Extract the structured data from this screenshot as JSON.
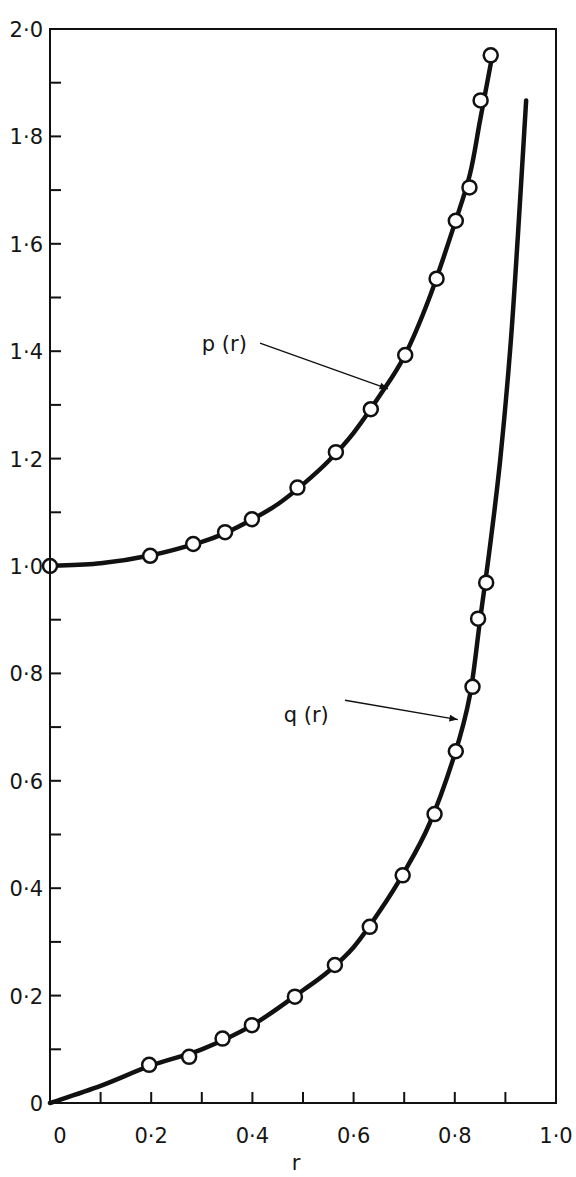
{
  "chart_data": {
    "type": "line",
    "title": "",
    "xlabel": "r",
    "ylabel": "",
    "xlim": [
      0,
      1.0
    ],
    "ylim": [
      0,
      2.0
    ],
    "grid": false,
    "legend": "inline labels with arrows",
    "x_ticks": [
      {
        "value": 0,
        "label": "0"
      },
      {
        "value": 0.2,
        "label": "0·2"
      },
      {
        "value": 0.4,
        "label": "0·4"
      },
      {
        "value": 0.6,
        "label": "0·6"
      },
      {
        "value": 0.8,
        "label": "0·8"
      },
      {
        "value": 1.0,
        "label": "1·0"
      }
    ],
    "x_minor_ticks": [
      0.1,
      0.3,
      0.5,
      0.7,
      0.9
    ],
    "y_ticks": [
      {
        "value": 0,
        "label": "0"
      },
      {
        "value": 0.2,
        "label": "0·2"
      },
      {
        "value": 0.4,
        "label": "0·4"
      },
      {
        "value": 0.6,
        "label": "0·6"
      },
      {
        "value": 0.8,
        "label": "0·8"
      },
      {
        "value": 1.0,
        "label": "1·0"
      },
      {
        "value": 1.2,
        "label": "1·2"
      },
      {
        "value": 1.4,
        "label": "1·4"
      },
      {
        "value": 1.6,
        "label": "1·6"
      },
      {
        "value": 1.8,
        "label": "1·8"
      },
      {
        "value": 2.0,
        "label": "2·0"
      }
    ],
    "y_minor_ticks": [
      0.1,
      0.3,
      0.5,
      0.7,
      0.9,
      1.1,
      1.3,
      1.5,
      1.7,
      1.9
    ],
    "series": [
      {
        "name": "p (r)",
        "curve": [
          [
            0,
            1.0
          ],
          [
            0.1,
            1.005
          ],
          [
            0.2,
            1.02
          ],
          [
            0.3,
            1.045
          ],
          [
            0.35,
            1.063
          ],
          [
            0.4,
            1.087
          ],
          [
            0.45,
            1.115
          ],
          [
            0.5,
            1.152
          ],
          [
            0.55,
            1.195
          ],
          [
            0.6,
            1.248
          ],
          [
            0.65,
            1.315
          ],
          [
            0.7,
            1.39
          ],
          [
            0.75,
            1.5
          ],
          [
            0.8,
            1.638
          ],
          [
            0.83,
            1.73
          ],
          [
            0.85,
            1.83
          ],
          [
            0.875,
            1.955
          ]
        ],
        "points": [
          [
            0,
            1.0
          ],
          [
            0.198,
            1.019
          ],
          [
            0.283,
            1.041
          ],
          [
            0.346,
            1.063
          ],
          [
            0.399,
            1.087
          ],
          [
            0.489,
            1.146
          ],
          [
            0.565,
            1.212
          ],
          [
            0.634,
            1.292
          ],
          [
            0.702,
            1.393
          ],
          [
            0.764,
            1.535
          ],
          [
            0.802,
            1.643
          ],
          [
            0.829,
            1.705
          ],
          [
            0.851,
            1.867
          ],
          [
            0.871,
            1.951
          ]
        ],
        "label_pos": [
          0.3,
          1.4
        ],
        "arrow_from": [
          0.415,
          1.415
        ],
        "arrow_to": [
          0.668,
          1.33
        ]
      },
      {
        "name": "q (r)",
        "curve": [
          [
            0,
            0
          ],
          [
            0.1,
            0.032
          ],
          [
            0.2,
            0.07
          ],
          [
            0.3,
            0.1
          ],
          [
            0.4,
            0.145
          ],
          [
            0.5,
            0.21
          ],
          [
            0.55,
            0.245
          ],
          [
            0.6,
            0.29
          ],
          [
            0.65,
            0.355
          ],
          [
            0.7,
            0.43
          ],
          [
            0.75,
            0.52
          ],
          [
            0.8,
            0.65
          ],
          [
            0.83,
            0.76
          ],
          [
            0.85,
            0.9
          ],
          [
            0.87,
            1.04
          ],
          [
            0.89,
            1.2
          ],
          [
            0.91,
            1.41
          ],
          [
            0.925,
            1.62
          ],
          [
            0.941,
            1.867
          ]
        ],
        "points": [
          [
            0.196,
            0.071
          ],
          [
            0.275,
            0.086
          ],
          [
            0.341,
            0.12
          ],
          [
            0.399,
            0.145
          ],
          [
            0.484,
            0.198
          ],
          [
            0.563,
            0.257
          ],
          [
            0.632,
            0.328
          ],
          [
            0.697,
            0.424
          ],
          [
            0.76,
            0.538
          ],
          [
            0.802,
            0.655
          ],
          [
            0.835,
            0.775
          ],
          [
            0.846,
            0.902
          ],
          [
            0.862,
            0.969
          ]
        ],
        "label_pos": [
          0.462,
          0.71
        ],
        "arrow_from": [
          0.583,
          0.75
        ],
        "arrow_to": [
          0.806,
          0.714
        ]
      }
    ]
  },
  "labels": {
    "p_label": "p (r)",
    "q_label": "q (r)",
    "x_axis_title": "r"
  },
  "style": {
    "line_color": "#111111",
    "marker_fill": "#ffffff",
    "background": "#ffffff"
  }
}
